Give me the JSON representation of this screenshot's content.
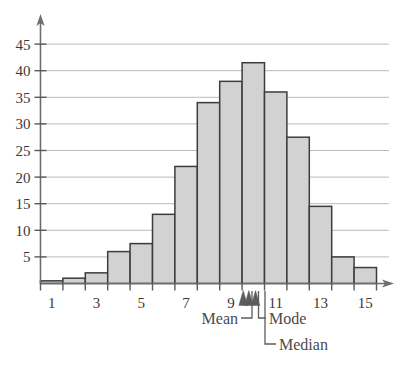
{
  "chart_data": {
    "type": "bar",
    "title": "",
    "subtitle": "",
    "xlabel": "",
    "ylabel": "",
    "categories": [
      1,
      2,
      3,
      4,
      5,
      6,
      7,
      8,
      9,
      10,
      11,
      12,
      13,
      14,
      15
    ],
    "values": [
      0.5,
      1,
      2,
      6,
      7.5,
      13,
      22,
      34,
      38,
      41.5,
      36,
      27.5,
      14.5,
      5,
      3
    ],
    "xlim": [
      0.5,
      15.5
    ],
    "ylim": [
      0,
      47
    ],
    "x_tick_labels": [
      "1",
      "3",
      "5",
      "7",
      "9",
      "11",
      "13",
      "15"
    ],
    "x_tick_values": [
      1,
      3,
      5,
      7,
      9,
      11,
      13,
      15
    ],
    "x_minor_tick_values": [
      0.5,
      1.5,
      2.5,
      3.5,
      4.5,
      5.5,
      6.5,
      7.5,
      8.5,
      9.5,
      10.5,
      11.5,
      12.5,
      13.5,
      14.5,
      15.5
    ],
    "y_tick_labels": [
      "5",
      "10",
      "15",
      "20",
      "25",
      "30",
      "35",
      "40",
      "45"
    ],
    "y_tick_values": [
      5,
      10,
      15,
      20,
      25,
      30,
      35,
      40,
      45
    ],
    "grid": true,
    "grid_axis": "y",
    "legend": "none",
    "bar_fill_color": "#d2d2d2",
    "bar_edge_color": "#3c3c3c",
    "gridline_color": "#b9b9b9",
    "axis_color": "#6e6e6e",
    "annotations": [
      {
        "name": "mean",
        "label": "Mean",
        "x_value": 9.55
      },
      {
        "name": "median",
        "label": "Median",
        "x_value": 9.8
      },
      {
        "name": "mode",
        "label": "Mode",
        "x_value": 10.1
      }
    ]
  },
  "axes": {
    "y_labels": [
      {
        "text": "45",
        "value": 45
      },
      {
        "text": "40",
        "value": 40
      },
      {
        "text": "35",
        "value": 35
      },
      {
        "text": "30",
        "value": 30
      },
      {
        "text": "25",
        "value": 25
      },
      {
        "text": "20",
        "value": 20
      },
      {
        "text": "15",
        "value": 15
      },
      {
        "text": "10",
        "value": 10
      },
      {
        "text": "5",
        "value": 5
      }
    ],
    "x_labels": [
      {
        "text": "1",
        "value": 1
      },
      {
        "text": "3",
        "value": 3
      },
      {
        "text": "5",
        "value": 5
      },
      {
        "text": "7",
        "value": 7
      },
      {
        "text": "9",
        "value": 9
      },
      {
        "text": "11",
        "value": 11
      },
      {
        "text": "13",
        "value": 13
      },
      {
        "text": "15",
        "value": 15
      }
    ]
  },
  "callouts": {
    "mean": "Mean",
    "mode": "Mode",
    "median": "Median"
  }
}
